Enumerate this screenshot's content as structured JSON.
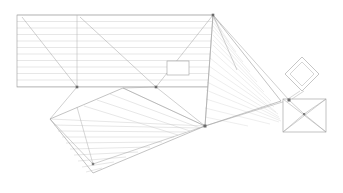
{
  "drawing": {
    "title": "Roof Plan",
    "background_color": "#ffffff",
    "line_color_hatch": "#cfcfcf",
    "line_color_outline": "#9a9a9a",
    "node_color": "#6b6b6b",
    "canvas": {
      "width": 343,
      "height": 193
    }
  },
  "regions": {
    "upper_left_panel": {
      "name": "upper-left-roof-panel",
      "polygon": "17,15 213,15 213,87 17,87",
      "hatch_direction": "horizontal",
      "hatch_count": 11,
      "hatch_spacing": 6.5
    },
    "upper_right_panel": {
      "name": "upper-right-roof-panel",
      "polygon": "213,15 281,101 205,126",
      "hatch_direction": "diagonal",
      "hatch_count": 16,
      "hatch_spacing": 7
    },
    "lower_left_panel": {
      "name": "lower-left-roof-panel",
      "polygon": "50,119 123,88 205,126 93,173",
      "hatch_direction": "slanted",
      "hatch_count": 10,
      "hatch_spacing": 8
    },
    "right_block": {
      "name": "right-rectangular-block",
      "rect": {
        "x": 283,
        "y": 99,
        "width": 43,
        "height": 33
      },
      "diagonals": true
    },
    "diamond": {
      "name": "diamond-marker",
      "center_x": 302,
      "center_y": 74,
      "outer_half": 17,
      "inner_half": 12,
      "stem_to_x": 288,
      "stem_to_y": 99
    },
    "center_opening": {
      "name": "center-opening-rectangle",
      "x": 167,
      "y": 61,
      "width": 22,
      "height": 14
    }
  },
  "vertices": [
    {
      "name": "apex-top-right",
      "x": 213,
      "y": 15,
      "size": 1.6
    },
    {
      "name": "valley-left",
      "x": 77,
      "y": 87,
      "size": 1.6
    },
    {
      "name": "valley-center",
      "x": 156,
      "y": 87,
      "size": 1.6
    },
    {
      "name": "junction-lower-center",
      "x": 205,
      "y": 126,
      "size": 1.8
    },
    {
      "name": "junction-right-node",
      "x": 289,
      "y": 100,
      "size": 1.8
    },
    {
      "name": "node-lower-left-panel",
      "x": 93,
      "y": 164,
      "size": 1.5
    },
    {
      "name": "node-block-center",
      "x": 304,
      "y": 114,
      "size": 1.3
    }
  ],
  "labels": {
    "none_visible": ""
  }
}
